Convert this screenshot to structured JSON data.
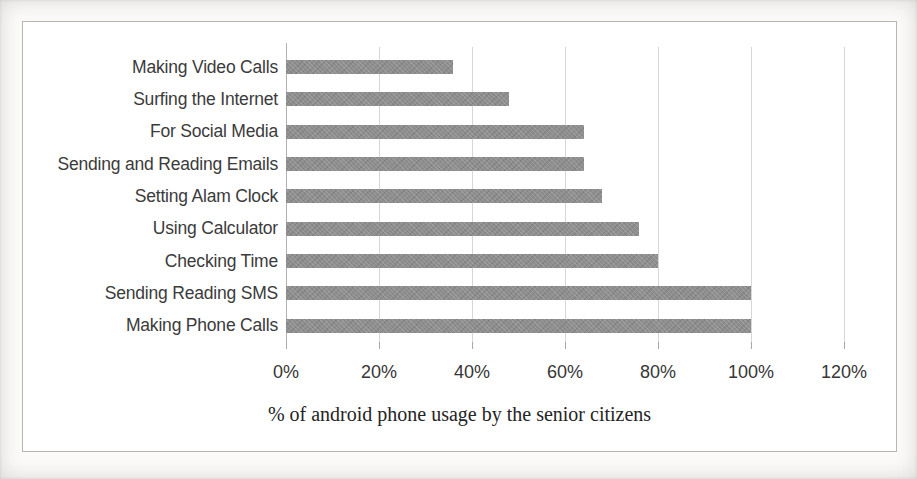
{
  "page": {
    "background": "#fcfbf9"
  },
  "chart_data": {
    "type": "bar",
    "orientation": "horizontal",
    "title": "",
    "categories": [
      "Making Video Calls",
      "Surfing the Internet",
      "For Social Media",
      "Sending and Reading Emails",
      "Setting Alam Clock",
      "Using Calculator",
      "Checking Time",
      "Sending Reading SMS",
      "Making Phone Calls"
    ],
    "categories_order": "top-to-bottom",
    "values": [
      36,
      48,
      64,
      64,
      68,
      76,
      80,
      100,
      100
    ],
    "value_unit": "%",
    "xlabel": "% of android phone usage by the senior citizens",
    "ylabel": "",
    "xlim": [
      0,
      120
    ],
    "x_tick_labels": [
      "0%",
      "20%",
      "40%",
      "60%",
      "80%",
      "100%",
      "120%"
    ],
    "x_tick_step": 20,
    "grid": true,
    "legend": "none",
    "bar_color": "#8e8e8e",
    "gridline_color": "#d8d7d4",
    "axis_line_color": "#b3b2ae",
    "label_text_color": "#3b3b3b",
    "tick_text_color": "#363636",
    "axis_title_color": "#242424"
  }
}
